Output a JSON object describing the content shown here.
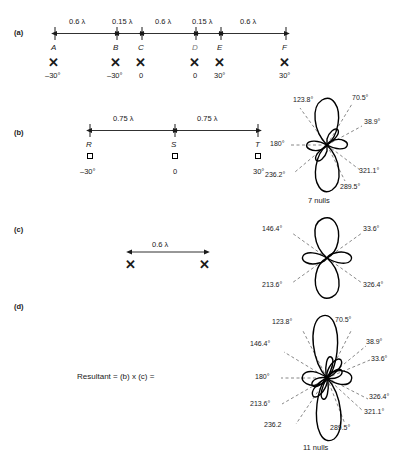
{
  "figure": {
    "panels": [
      "(a)",
      "(b)",
      "(c)",
      "(d)"
    ]
  },
  "panel_a": {
    "tag": "(a)",
    "spacings": [
      "0.6 λ",
      "0.15 λ",
      "0.6 λ",
      "0.15 λ",
      "0.6 λ"
    ],
    "elements": [
      {
        "name": "A",
        "phase": "–30°",
        "x": 55
      },
      {
        "name": "B",
        "phase": "–30°",
        "x": 117
      },
      {
        "name": "C",
        "phase": "0",
        "x": 142
      },
      {
        "name": "D",
        "phase": "0",
        "x": 196
      },
      {
        "name": "E",
        "phase": "30°",
        "x": 221
      },
      {
        "name": "F",
        "phase": "30°",
        "x": 286
      }
    ],
    "marker": "✕"
  },
  "panel_b": {
    "tag": "(b)",
    "spacings": [
      "0.75 λ",
      "0.75 λ"
    ],
    "elements": [
      {
        "name": "R",
        "phase": "–30°",
        "x": 90
      },
      {
        "name": "S",
        "phase": "0",
        "x": 175
      },
      {
        "name": "T",
        "phase": "30°",
        "x": 258
      }
    ],
    "marker": "square",
    "pattern": {
      "nulls_label": "7 nulls",
      "null_count": 7,
      "angles": [
        "70.5°",
        "38.9°",
        "321.1°",
        "289.5°",
        "236.2°",
        "180°",
        "123.8°"
      ]
    }
  },
  "panel_c": {
    "tag": "(c)",
    "spacing": "0.6 λ",
    "elements": [
      {
        "x": 131
      },
      {
        "x": 205
      }
    ],
    "marker": "✕",
    "pattern": {
      "null_count": 4,
      "angles": [
        "33.6°",
        "146.4°",
        "213.6°",
        "326.4°"
      ]
    }
  },
  "panel_d": {
    "tag": "(d)",
    "equation": "Resultant = (b) x (c) =",
    "pattern": {
      "nulls_label": "11 nulls",
      "null_count": 11,
      "angles": [
        "70.5°",
        "38.9°",
        "33.6°",
        "326.4°",
        "321.1°",
        "289.5°",
        "236.2",
        "213.6°",
        "180°",
        "146.4°",
        "123.8°"
      ]
    }
  },
  "colors": {
    "ink": "#1a1a1a",
    "background": "#ffffff",
    "dash": "#555555"
  }
}
